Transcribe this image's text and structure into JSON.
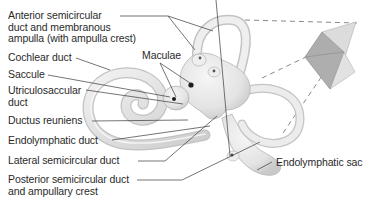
{
  "diagram": {
    "labels": {
      "anterior_1": "Anterior semicircular",
      "anterior_2": "duct and membranous",
      "anterior_3": "ampulla (with ampulla crest)",
      "cochlear": "Cochlear duct",
      "saccule": "Saccule",
      "utriculosaccular_1": "Utriculosaccular",
      "utriculosaccular_2": "duct",
      "maculae": "Maculae",
      "ductus_reuniens": "Ductus reuniens",
      "endolymphatic_duct": "Endolymphatic duct",
      "lateral": "Lateral semicircular duct",
      "posterior_1": "Posterior semicircular duct",
      "posterior_2": "and ampullary crest",
      "endolymphatic_sac": "Endolymphatic sac"
    },
    "colors": {
      "structure_fill": "#e9e9e9",
      "structure_shade": "#cfcfcf",
      "structure_edge": "#b5b5b5",
      "leader_line": "#3a3a3a",
      "text": "#2a2a2a",
      "inset_dark": "#a9a9a9",
      "inset_light": "#dcdcdc",
      "dashes": "#8a8a8a"
    },
    "inset": {
      "description": "Orientation of semicircular duct planes",
      "icon": "orthogonal-planes-icon"
    }
  }
}
